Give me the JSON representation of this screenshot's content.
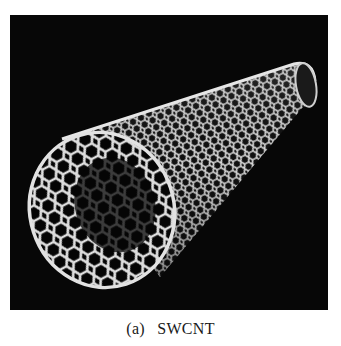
{
  "figure": {
    "panel_label": "(a)",
    "caption": "SWCNT",
    "background_color": "#070707",
    "lattice_color": "#dcdcdc"
  }
}
